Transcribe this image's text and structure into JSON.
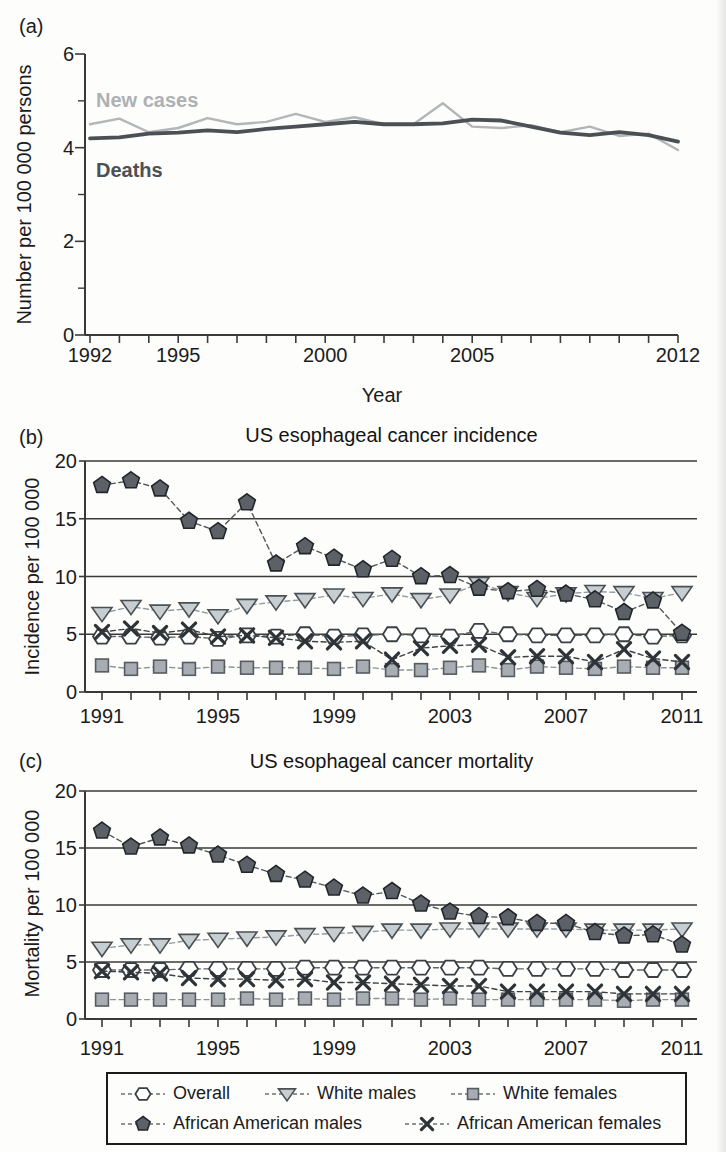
{
  "figure": {
    "background": "#fdfdfb",
    "text_color": "#1b1b1b",
    "axis_color": "#3a3a3a"
  },
  "marker_styles": {
    "hexagon": {
      "fill": "#ffffff",
      "edge": "#3a3f44"
    },
    "triangle_down": {
      "fill": "#c7ced2",
      "edge": "#4a5054"
    },
    "square": {
      "fill": "#a7adb2",
      "edge": "#565c61"
    },
    "pentagon": {
      "fill": "#5b6167",
      "edge": "#22262a"
    },
    "x": {
      "fill": "none",
      "edge": "#2e3338"
    }
  },
  "legend": {
    "entries": [
      {
        "label": "Overall",
        "marker": "hexagon"
      },
      {
        "label": "White males",
        "marker": "triangle_down"
      },
      {
        "label": "White females",
        "marker": "square"
      },
      {
        "label": "African American males",
        "marker": "pentagon"
      },
      {
        "label": "African American females",
        "marker": "x"
      }
    ]
  },
  "chart_data": [
    {
      "type": "line",
      "panel_label": "(a)",
      "title": "",
      "xlabel": "Year",
      "ylabel": "Number per 100 000 persons",
      "ylim": [
        0,
        6
      ],
      "yticks": [
        0,
        2,
        4,
        6
      ],
      "yticks_minor": [
        1,
        3,
        5
      ],
      "xticks_labeled": [
        1992,
        1995,
        2000,
        2005,
        2012
      ],
      "grid": false,
      "legend_position": "inline-annotations",
      "years": [
        1992,
        1993,
        1994,
        1995,
        1996,
        1997,
        1998,
        1999,
        2000,
        2001,
        2002,
        2003,
        2004,
        2005,
        2006,
        2007,
        2008,
        2009,
        2010,
        2011,
        2012
      ],
      "series": [
        {
          "name": "New cases",
          "marker": "none",
          "dash": "solid",
          "color": "#b2b6b8",
          "line_width": 2.4,
          "values": [
            4.5,
            4.62,
            4.33,
            4.42,
            4.63,
            4.5,
            4.55,
            4.72,
            4.55,
            4.65,
            4.5,
            4.5,
            4.95,
            4.45,
            4.42,
            4.48,
            4.33,
            4.45,
            4.25,
            4.3,
            3.95
          ]
        },
        {
          "name": "Deaths",
          "marker": "none",
          "dash": "solid",
          "color": "#4b5055",
          "line_width": 3.8,
          "values": [
            4.2,
            4.22,
            4.3,
            4.32,
            4.37,
            4.33,
            4.4,
            4.45,
            4.5,
            4.55,
            4.5,
            4.5,
            4.52,
            4.6,
            4.58,
            4.45,
            4.32,
            4.27,
            4.33,
            4.27,
            4.13
          ]
        }
      ],
      "annotations": [
        {
          "text": "New cases",
          "color": "#adb1b3",
          "x": 1992.3,
          "y": 5.0
        },
        {
          "text": "Deaths",
          "color": "#4b5055",
          "x": 1992.3,
          "y": 3.5
        }
      ]
    },
    {
      "type": "line",
      "panel_label": "(b)",
      "title": "US esophageal cancer incidence",
      "xlabel": "",
      "ylabel": "Incidence per 100 000",
      "ylim": [
        0,
        20
      ],
      "yticks": [
        0,
        5,
        10,
        15,
        20
      ],
      "gridlines_y": [
        5,
        10,
        15,
        20
      ],
      "xticks_labeled": [
        1991,
        1995,
        1999,
        2003,
        2007,
        2011
      ],
      "grid": true,
      "years": [
        1991,
        1992,
        1993,
        1994,
        1995,
        1996,
        1997,
        1998,
        1999,
        2000,
        2001,
        2002,
        2003,
        2004,
        2005,
        2006,
        2007,
        2008,
        2009,
        2010,
        2011
      ],
      "series": [
        {
          "name": "Overall",
          "marker": "hexagon",
          "dash": "dashed",
          "color": "#606569",
          "line_width": 1.4,
          "values": [
            4.8,
            4.8,
            4.7,
            4.8,
            4.6,
            4.9,
            4.8,
            5.0,
            4.8,
            4.9,
            5.0,
            4.9,
            4.8,
            5.3,
            5.0,
            4.9,
            4.9,
            4.9,
            5.0,
            4.8,
            4.9
          ]
        },
        {
          "name": "White males",
          "marker": "triangle_down",
          "dash": "dashed",
          "color": "#949a9e",
          "line_width": 1.4,
          "values": [
            6.8,
            7.4,
            7.0,
            7.2,
            6.6,
            7.5,
            7.8,
            8.0,
            8.4,
            8.1,
            8.5,
            8.0,
            8.4,
            9.4,
            8.6,
            8.1,
            8.5,
            8.7,
            8.6,
            8.1,
            8.6
          ]
        },
        {
          "name": "White females",
          "marker": "square",
          "dash": "dashed",
          "color": "#8d9397",
          "line_width": 1.4,
          "values": [
            2.3,
            2.0,
            2.2,
            2.0,
            2.2,
            2.1,
            2.1,
            2.1,
            2.0,
            2.2,
            1.9,
            1.9,
            2.1,
            2.3,
            1.9,
            2.2,
            2.1,
            2.0,
            2.2,
            2.1,
            2.1
          ]
        },
        {
          "name": "African American males",
          "marker": "pentagon",
          "dash": "dashed",
          "color": "#50565b",
          "line_width": 1.4,
          "values": [
            17.9,
            18.3,
            17.6,
            14.8,
            13.9,
            16.4,
            11.1,
            12.6,
            11.6,
            10.6,
            11.5,
            10.0,
            10.1,
            9.0,
            8.7,
            8.9,
            8.5,
            8.0,
            6.9,
            7.9,
            5.1
          ]
        },
        {
          "name": "African American females",
          "marker": "x",
          "dash": "dashed",
          "color": "#3c4145",
          "line_width": 1.4,
          "values": [
            5.2,
            5.5,
            5.1,
            5.4,
            4.8,
            4.9,
            4.7,
            4.4,
            4.3,
            4.4,
            2.8,
            3.8,
            4.0,
            4.1,
            3.0,
            3.1,
            3.1,
            2.6,
            3.7,
            2.9,
            2.6
          ]
        }
      ]
    },
    {
      "type": "line",
      "panel_label": "(c)",
      "title": "US esophageal cancer mortality",
      "xlabel": "",
      "ylabel": "Mortality per 100 000",
      "ylim": [
        0,
        20
      ],
      "yticks": [
        0,
        5,
        10,
        15,
        20
      ],
      "gridlines_y": [
        5,
        10,
        15,
        20
      ],
      "xticks_labeled": [
        1991,
        1995,
        1999,
        2003,
        2007,
        2011
      ],
      "grid": true,
      "years": [
        1991,
        1992,
        1993,
        1994,
        1995,
        1996,
        1997,
        1998,
        1999,
        2000,
        2001,
        2002,
        2003,
        2004,
        2005,
        2006,
        2007,
        2008,
        2009,
        2010,
        2011
      ],
      "series": [
        {
          "name": "Overall",
          "marker": "hexagon",
          "dash": "dashed",
          "color": "#606569",
          "line_width": 1.4,
          "values": [
            4.3,
            4.3,
            4.3,
            4.4,
            4.4,
            4.4,
            4.4,
            4.5,
            4.5,
            4.5,
            4.5,
            4.5,
            4.5,
            4.5,
            4.4,
            4.4,
            4.4,
            4.4,
            4.3,
            4.3,
            4.3
          ]
        },
        {
          "name": "White males",
          "marker": "triangle_down",
          "dash": "dashed",
          "color": "#949a9e",
          "line_width": 1.4,
          "values": [
            6.2,
            6.5,
            6.5,
            6.9,
            7.0,
            7.1,
            7.2,
            7.4,
            7.5,
            7.6,
            7.8,
            7.8,
            7.9,
            7.9,
            7.9,
            7.9,
            7.9,
            7.8,
            7.8,
            7.8,
            7.9
          ]
        },
        {
          "name": "White females",
          "marker": "square",
          "dash": "dashed",
          "color": "#8d9397",
          "line_width": 1.4,
          "values": [
            1.7,
            1.7,
            1.7,
            1.7,
            1.7,
            1.8,
            1.7,
            1.8,
            1.7,
            1.8,
            1.8,
            1.7,
            1.8,
            1.7,
            1.7,
            1.7,
            1.7,
            1.7,
            1.6,
            1.7,
            1.7
          ]
        },
        {
          "name": "African American males",
          "marker": "pentagon",
          "dash": "dashed",
          "color": "#50565b",
          "line_width": 1.4,
          "values": [
            16.5,
            15.1,
            15.9,
            15.2,
            14.4,
            13.5,
            12.7,
            12.2,
            11.5,
            10.8,
            11.2,
            10.1,
            9.4,
            9.0,
            8.9,
            8.4,
            8.4,
            7.6,
            7.3,
            7.4,
            6.5
          ]
        },
        {
          "name": "African American females",
          "marker": "x",
          "dash": "dashed",
          "color": "#3c4145",
          "line_width": 1.4,
          "values": [
            4.2,
            4.1,
            4.0,
            3.6,
            3.5,
            3.5,
            3.4,
            3.5,
            3.2,
            3.2,
            3.1,
            3.0,
            2.9,
            2.9,
            2.4,
            2.4,
            2.4,
            2.4,
            2.2,
            2.2,
            2.2
          ]
        }
      ]
    }
  ]
}
